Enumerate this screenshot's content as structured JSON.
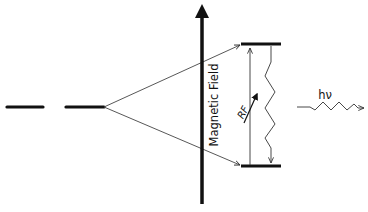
{
  "diagram": {
    "labels": {
      "axis": "Magnetic Field",
      "rf": "RF",
      "photon": "hν"
    },
    "elements": {
      "zero_field_levels": 2,
      "split_levels": [
        "upper",
        "lower"
      ],
      "transitions": [
        "RF absorption (upward arrow)",
        "relaxation (wavy downward arrow)",
        "photon emission hν (wavy arrow to right)"
      ]
    },
    "colors": {
      "line": "#111111",
      "thin_line": "#333333",
      "background": "#ffffff"
    }
  }
}
